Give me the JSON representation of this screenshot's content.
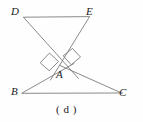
{
  "figure": {
    "caption": "( d )",
    "stroke_color": "#7a7a7a",
    "label_color": "#1a1a1a",
    "background_color": "#fefefe",
    "labels": {
      "D": "D",
      "E": "E",
      "A": "A",
      "B": "B",
      "C": "C"
    },
    "points": {
      "D": [
        23,
        17
      ],
      "E": [
        89,
        17
      ],
      "A": [
        64,
        68
      ],
      "B": [
        22,
        93
      ],
      "C": [
        122,
        93
      ]
    },
    "segments": [
      {
        "name": "segment-DE",
        "from": "D",
        "to": "E"
      },
      {
        "name": "segment-D-through-A",
        "from": "D",
        "to": "A-extended-right"
      },
      {
        "name": "segment-E-through-A",
        "from": "E",
        "to": "A-extended-left"
      },
      {
        "name": "segment-BA-extended",
        "from": "B",
        "to": "A-extended"
      },
      {
        "name": "segment-AC",
        "from": "A",
        "to": "C"
      },
      {
        "name": "segment-BC",
        "from": "B",
        "to": "C"
      }
    ],
    "right_angle_marks": [
      {
        "name": "right-angle-mark-left",
        "at": [
          48,
          61
        ]
      },
      {
        "name": "right-angle-mark-right",
        "at": [
          71,
          58
        ]
      }
    ]
  }
}
